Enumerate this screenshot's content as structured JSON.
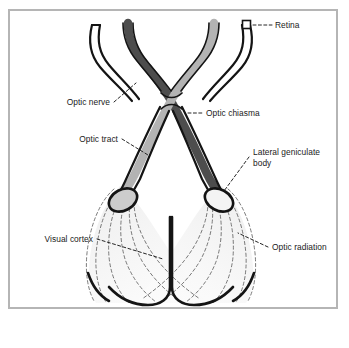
{
  "figure": {
    "background_color": "#ffffff",
    "frame_border_color": "#b5b5b5"
  },
  "colors": {
    "outline": "#141414",
    "dark_tract": "#4d4d4d",
    "light_tract": "#b3b3b3",
    "lgb_left_fill": "#cccccc",
    "lgb_right_fill": "#f2f2f2",
    "radiation_fill": "#f4f4f4",
    "radiation_stroke": "#555555",
    "leader_line": "#333333",
    "text": "#1a1a1a"
  },
  "labels": {
    "retina": "Retina",
    "optic_nerve": "Optic nerve",
    "optic_chiasma": "Optic chiasma",
    "optic_tract": "Optic tract",
    "lateral_geniculate_body_line1": "Lateral geniculate",
    "lateral_geniculate_body_line2": "body",
    "visual_cortex": "Visual cortex",
    "optic_radiation": "Optic radiation"
  },
  "structures": [
    {
      "name": "retina",
      "label": "Retina",
      "side": "right",
      "marker": "square"
    },
    {
      "name": "optic-nerve",
      "label": "Optic nerve",
      "side": "left"
    },
    {
      "name": "optic-chiasma",
      "label": "Optic chiasma",
      "side": "center"
    },
    {
      "name": "optic-tract",
      "label": "Optic tract",
      "side": "left"
    },
    {
      "name": "lateral-geniculate-body",
      "label": "Lateral geniculate body",
      "side": "right"
    },
    {
      "name": "visual-cortex",
      "label": "Visual cortex",
      "side": "left"
    },
    {
      "name": "optic-radiation",
      "label": "Optic radiation",
      "side": "right"
    }
  ]
}
